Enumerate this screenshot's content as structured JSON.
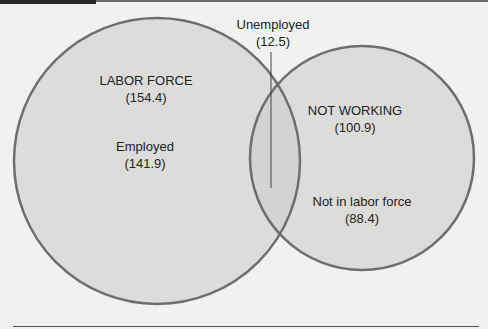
{
  "diagram": {
    "type": "venn",
    "colors": {
      "background": "#f1f1ef",
      "circle_fill": "#dcdcda",
      "overlap_fill": "#d2d2d0",
      "stroke": "#6e6e6e",
      "text": "#222222"
    },
    "circles": [
      {
        "name": "labor-force",
        "title": "LABOR FORCE",
        "value": "(154.4)"
      },
      {
        "name": "not-working",
        "title": "NOT WORKING",
        "value": "(100.9)"
      }
    ],
    "regions": [
      {
        "name": "employed",
        "title": "Employed",
        "value": "(141.9)"
      },
      {
        "name": "unemployed",
        "title": "Unemployed",
        "value": "(12.5)"
      },
      {
        "name": "not-in-labor-force",
        "title": "Not in labor force",
        "value": "(88.4)"
      }
    ]
  }
}
